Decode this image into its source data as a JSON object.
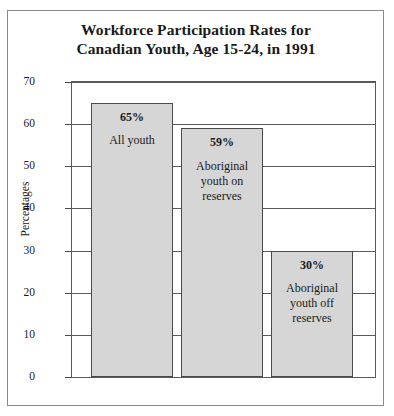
{
  "chart_data": {
    "type": "bar",
    "title": "Workforce Participation Rates for Canadian Youth, Age 15-24, in 1991",
    "title_lines": [
      "Workforce Participation Rates for",
      "Canadian Youth, Age 15-24, in 1991"
    ],
    "xlabel": "",
    "ylabel": "Percentages",
    "ylim": [
      0,
      70
    ],
    "ytick_labels": [
      "70",
      "60",
      "50",
      "40",
      "30",
      "20",
      "10",
      "0"
    ],
    "ytick_values": [
      70,
      60,
      50,
      40,
      30,
      20,
      10,
      0
    ],
    "grid": true,
    "legend": "none",
    "bar_color": "#d6d6d6",
    "bar_border_color": "#4a4a4a",
    "categories": [
      "All youth",
      "Aboriginal youth on reserves",
      "Aboriginal youth off reserves"
    ],
    "values": [
      65,
      59,
      30
    ],
    "bars": [
      {
        "value": 65,
        "value_label": "65%",
        "category_lines": [
          "All youth"
        ]
      },
      {
        "value": 59,
        "value_label": "59%",
        "category_lines": [
          "Aboriginal",
          "youth on",
          "reserves"
        ]
      },
      {
        "value": 30,
        "value_label": "30%",
        "category_lines": [
          "Aboriginal",
          "youth off",
          "reserves"
        ]
      }
    ]
  }
}
